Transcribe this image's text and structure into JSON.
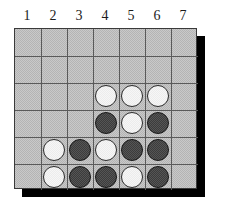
{
  "board": {
    "columns": 7,
    "rows": 6,
    "column_headers": [
      "1",
      "2",
      "3",
      "4",
      "5",
      "6",
      "7"
    ],
    "colors": {
      "board_fill": "#b4b4b4",
      "board_fill_dither": "#c9c9c9",
      "grid_line": "#5a5a5a",
      "border": "#3a3a3a",
      "shadow": "#000000",
      "white_piece": "#ececec",
      "white_piece_outline": "#2b2b2b",
      "dark_piece": "#3c3c3c",
      "dark_piece_outline": "#1a1a1a",
      "header_text": "#1b1b1b"
    },
    "cells": [
      [
        null,
        null,
        null,
        null,
        null,
        null,
        null
      ],
      [
        null,
        null,
        null,
        null,
        null,
        null,
        null
      ],
      [
        null,
        null,
        null,
        "white",
        "white",
        "white",
        null
      ],
      [
        null,
        null,
        null,
        "dark",
        "white",
        "dark",
        null
      ],
      [
        null,
        "white",
        "dark",
        "white",
        "dark",
        "dark",
        null
      ],
      [
        null,
        "white",
        "dark",
        "dark",
        "white",
        "dark",
        null
      ]
    ]
  }
}
